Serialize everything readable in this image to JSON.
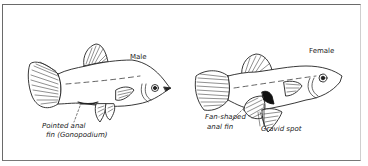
{
  "figure": {
    "fish": [
      {
        "id": "male",
        "title": "Male",
        "annotation": [
          "Pointed anal",
          "fin (Gonopodium)"
        ]
      },
      {
        "id": "female",
        "title": "Female",
        "annotations": [
          {
            "lines": [
              "Fan-shaped",
              "anal fin"
            ]
          },
          {
            "lines": [
              "Gravid spot"
            ]
          }
        ]
      }
    ],
    "colors": {
      "ink": "#222222",
      "frame": "#6a6a6a",
      "background": "#ffffff"
    }
  }
}
